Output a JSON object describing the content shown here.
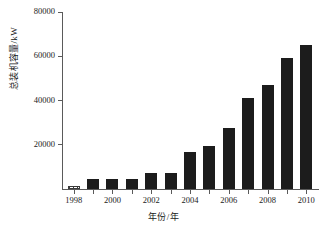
{
  "chart_data": {
    "type": "bar",
    "title": "",
    "xlabel": "年份/年",
    "ylabel": "总装机容量/kW",
    "categories": [
      1998,
      1999,
      2000,
      2001,
      2002,
      2003,
      2004,
      2005,
      2006,
      2007,
      2008,
      2009,
      2010
    ],
    "values": [
      1200,
      4500,
      4600,
      4600,
      7200,
      7200,
      16500,
      19600,
      27500,
      41000,
      47000,
      59000,
      65000
    ],
    "series": [
      {
        "name": "总装机容量",
        "values": [
          1200,
          4500,
          4600,
          4600,
          7200,
          7200,
          16500,
          19600,
          27500,
          41000,
          47000,
          59000,
          65000
        ]
      }
    ],
    "bar_styles": [
      "hatched",
      "filled",
      "filled",
      "filled",
      "filled",
      "filled",
      "filled",
      "filled",
      "filled",
      "filled",
      "filled",
      "filled",
      "filled"
    ],
    "ylim": [
      0,
      80000
    ],
    "xlim": [
      1997.4,
      2010.6
    ],
    "yticks": [
      0,
      20000,
      40000,
      60000,
      80000
    ],
    "ytick_labels": [
      "",
      "20000",
      "40000",
      "60000",
      "80000"
    ],
    "xticks": [
      1998,
      1999,
      2000,
      2001,
      2002,
      2003,
      2004,
      2005,
      2006,
      2007,
      2008,
      2009,
      2010
    ],
    "xtick_labels": [
      "1998",
      "",
      "2000",
      "",
      "2002",
      "",
      "2004",
      "",
      "2006",
      "",
      "2008",
      "",
      "2010"
    ],
    "grid": false,
    "legend": false,
    "bar_color": "#1c1c1c",
    "axis_color": "#5a5a5a",
    "background": "#ffffff"
  }
}
